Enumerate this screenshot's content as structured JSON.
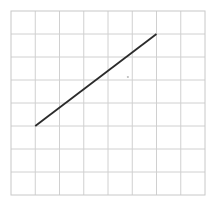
{
  "figure": {
    "title": "",
    "background_color": "#ffffff",
    "width": 217,
    "height": 206
  },
  "grid": {
    "label": "graph-paper-grid",
    "line_color": "#d0d0d0",
    "line_width": 1,
    "columns": 8,
    "rows": 8,
    "left": 11,
    "top": 11,
    "right": 205,
    "bottom": 195,
    "cell_width": 24.25,
    "cell_height": 23.0,
    "border_color": "#c8c8c8"
  },
  "chart_data": {
    "type": "line",
    "title": "",
    "xlabel": "",
    "ylabel": "",
    "xlim": [
      0,
      8
    ],
    "ylim": [
      0,
      8
    ],
    "grid": true,
    "legend": null,
    "series": [
      {
        "name": "segment",
        "color": "#2b2b2b",
        "line_width": 1.8,
        "x": [
          1,
          6
        ],
        "y": [
          3,
          7
        ]
      }
    ],
    "annotations": [
      {
        "name": "faint-mark",
        "x": 4.82,
        "y": 5.13,
        "color": "#bdbdbd"
      }
    ]
  },
  "overlay": {
    "mark_label": "",
    "mark_color": "#bdbdbd"
  }
}
